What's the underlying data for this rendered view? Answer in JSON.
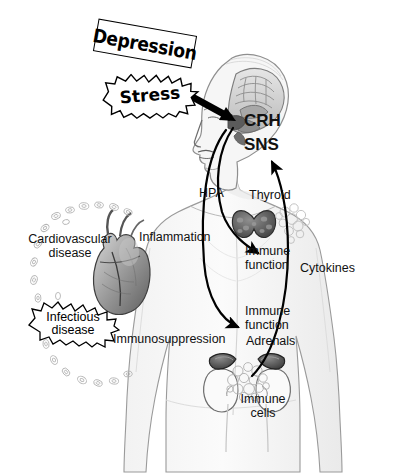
{
  "figure": {
    "background_color": "#ffffff",
    "ink_color": "#111111"
  },
  "callouts": [
    {
      "id": "depression",
      "label": "Depression",
      "style": "rotated-box"
    },
    {
      "id": "stress",
      "label": "Stress",
      "style": "starburst"
    },
    {
      "id": "infectious-disease",
      "label": "Infectious disease",
      "line1": "Infectious",
      "line2": "disease",
      "style": "starburst"
    }
  ],
  "brain_labels": [
    {
      "id": "crh",
      "label": "CRH"
    },
    {
      "id": "sns",
      "label": "SNS"
    }
  ],
  "pathway_labels": [
    {
      "id": "hpa",
      "label": "HPA"
    },
    {
      "id": "cytokines",
      "label": "Cytokines"
    }
  ],
  "organ_labels": [
    {
      "id": "thyroid",
      "label": "Thyroid"
    },
    {
      "id": "adrenals",
      "label": "Adrenals"
    },
    {
      "id": "immune-cells",
      "line1": "Immune",
      "line2": "cells",
      "label": "Immune cells"
    }
  ],
  "outcome_labels": [
    {
      "id": "immune-function-upper",
      "line1": "Immune",
      "line2": "function",
      "label": "Immune function"
    },
    {
      "id": "immune-function-lower",
      "line1": "Immune",
      "line2": "function",
      "label": "Immune function"
    },
    {
      "id": "cardiovascular-disease",
      "line1": "Cardiovascular",
      "line2": "disease",
      "label": "Cardiovascular disease"
    },
    {
      "id": "inflammation",
      "label": "Inflammation"
    },
    {
      "id": "immunosuppression",
      "label": "Immunosuppression"
    }
  ]
}
